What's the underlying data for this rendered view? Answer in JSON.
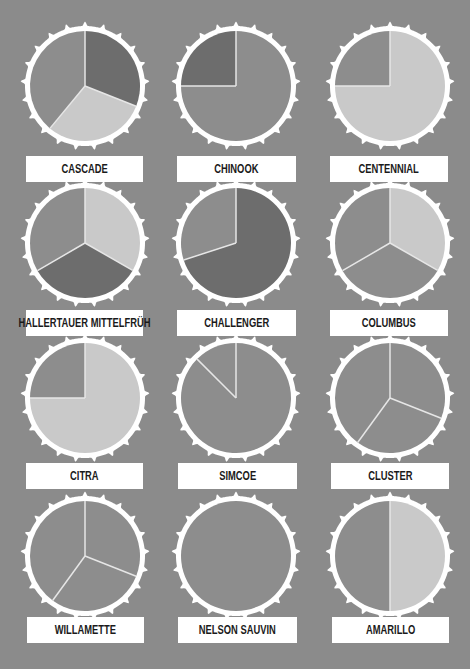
{
  "colors": {
    "background": "#8b8b8b",
    "cap": "#ffffff",
    "dark": "#6d6d6d",
    "medium": "#8d8d8d",
    "light": "#c9c9c9",
    "divider": "#e6e6e6",
    "label_bg": "#ffffff",
    "label_text": "#1a1a1a"
  },
  "chart_data": {
    "type": "pie",
    "title": "",
    "layout": {
      "grid": "4 rows x 3 columns of bottle-cap pie charts",
      "legend": "none"
    },
    "charts": [
      {
        "name": "CASCADE",
        "slices": [
          {
            "tone": "dark",
            "value": 31
          },
          {
            "tone": "light",
            "value": 30
          },
          {
            "tone": "medium",
            "value": 39
          }
        ]
      },
      {
        "name": "CHINOOK",
        "slices": [
          {
            "tone": "medium",
            "value": 75
          },
          {
            "tone": "dark",
            "value": 25
          }
        ]
      },
      {
        "name": "CENTENNIAL",
        "slices": [
          {
            "tone": "light",
            "value": 75
          },
          {
            "tone": "medium",
            "value": 25
          }
        ]
      },
      {
        "name": "HALLERTAUER MITTELFRÜH",
        "slices": [
          {
            "tone": "light",
            "value": 33.3
          },
          {
            "tone": "dark",
            "value": 33.3
          },
          {
            "tone": "medium",
            "value": 33.4
          }
        ]
      },
      {
        "name": "CHALLENGER",
        "slices": [
          {
            "tone": "dark",
            "value": 70
          },
          {
            "tone": "medium",
            "value": 30
          }
        ]
      },
      {
        "name": "COLUMBUS",
        "slices": [
          {
            "tone": "light",
            "value": 33.3
          },
          {
            "tone": "medium",
            "value": 33.3
          },
          {
            "tone": "medium",
            "value": 33.4
          }
        ]
      },
      {
        "name": "CITRA",
        "slices": [
          {
            "tone": "light",
            "value": 75
          },
          {
            "tone": "medium",
            "value": 25
          }
        ]
      },
      {
        "name": "SIMCOE",
        "slices": [
          {
            "tone": "medium",
            "value": 87.5
          },
          {
            "tone": "medium",
            "value": 12.5
          }
        ]
      },
      {
        "name": "CLUSTER",
        "slices": [
          {
            "tone": "medium",
            "value": 31
          },
          {
            "tone": "medium",
            "value": 29
          },
          {
            "tone": "medium",
            "value": 40
          }
        ]
      },
      {
        "name": "WILLAMETTE",
        "slices": [
          {
            "tone": "medium",
            "value": 31
          },
          {
            "tone": "medium",
            "value": 29
          },
          {
            "tone": "medium",
            "value": 40
          }
        ]
      },
      {
        "name": "NELSON SAUVIN",
        "slices": [
          {
            "tone": "medium",
            "value": 100
          }
        ]
      },
      {
        "name": "AMARILLO",
        "slices": [
          {
            "tone": "light",
            "value": 50
          },
          {
            "tone": "medium",
            "value": 50
          }
        ]
      }
    ]
  },
  "labels": [
    "CASCADE",
    "CHINOOK",
    "CENTENNIAL",
    "HALLERTAUER MITTELFRÜH",
    "CHALLENGER",
    "COLUMBUS",
    "CITRA",
    "SIMCOE",
    "CLUSTER",
    "WILLAMETTE",
    "NELSON SAUVIN",
    "AMARILLO"
  ]
}
